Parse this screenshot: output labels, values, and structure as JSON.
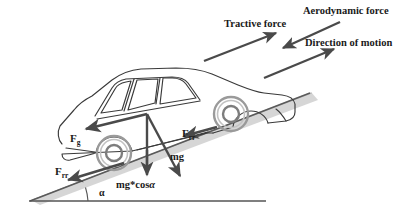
{
  "figure": {
    "background_color": "#ffffff",
    "arrow_color": "#4a4a4a",
    "car_outline_color": "#3a3a3a",
    "road_color": "#d0d0d0",
    "ground_line_color": "#555555",
    "text_color": "#1a1a1a"
  },
  "callouts": {
    "tractive_force": "Tractive force",
    "aerodynamic_force": "Aerodynamic force",
    "direction_of_motion": "Direction of motion"
  },
  "forces": {
    "grade_symbol": "F",
    "grade_subscript": "g",
    "rolling_symbol": "F",
    "rolling_subscript": "rr",
    "weight": "mg",
    "weight_normal_component": "mg*cos",
    "weight_normal_component_angle": "α"
  },
  "angle": {
    "label": "α"
  },
  "annotations": [
    {
      "name": "tractive-force",
      "text": "Tractive force",
      "points": "up-slope"
    },
    {
      "name": "aerodynamic-force",
      "text": "Aerodynamic force",
      "points": "down-slope"
    },
    {
      "name": "direction-of-motion",
      "text": "Direction of motion",
      "points": "up-slope"
    },
    {
      "name": "grade-force",
      "text": "Fg",
      "points": "down-slope"
    },
    {
      "name": "rolling-resistance-rear",
      "text": "Frr",
      "points": "down-slope"
    },
    {
      "name": "rolling-resistance-front",
      "text": "Frr",
      "points": "down-slope"
    },
    {
      "name": "weight",
      "text": "mg",
      "points": "down-right"
    },
    {
      "name": "weight-normal",
      "text": "mg*cosα",
      "points": "down"
    },
    {
      "name": "incline-angle",
      "text": "α",
      "points": "none"
    }
  ]
}
